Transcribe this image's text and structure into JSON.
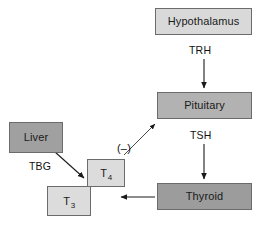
{
  "diagram": {
    "nodes": {
      "hypothalamus": {
        "label": "Hypothalamus",
        "fill": "#d9d9d9"
      },
      "pituitary": {
        "label": "Pituitary",
        "fill": "#b2b2b2"
      },
      "thyroid": {
        "label": "Thyroid",
        "fill": "#9c9c9c"
      },
      "liver": {
        "label": "Liver",
        "fill": "#a0a0a0"
      },
      "t4": {
        "label_base": "T",
        "label_sub": "4",
        "fill": "#dcdcdc"
      },
      "t3": {
        "label_base": "T",
        "label_sub": "3",
        "fill": "#dcdcdc"
      }
    },
    "edges": {
      "trh": {
        "label": "TRH",
        "from": "hypothalamus",
        "to": "pituitary"
      },
      "tsh": {
        "label": "TSH",
        "from": "pituitary",
        "to": "thyroid"
      },
      "tbg": {
        "label": "TBG",
        "from": "liver",
        "to": "t4"
      },
      "feedback": {
        "label": "(–)",
        "from": "t4",
        "to": "pituitary"
      },
      "thyroid_output": {
        "label": "",
        "from": "thyroid",
        "to": "t3"
      }
    },
    "stroke_color": "#1a1a1a",
    "border_color": "#6b6b6b"
  }
}
